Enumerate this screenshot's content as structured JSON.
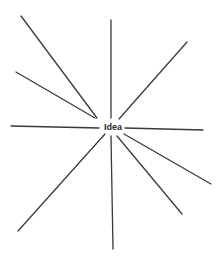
{
  "diagram": {
    "type": "radial-brainstorm",
    "center_label": "Idea",
    "line_color": "#3a3a3a",
    "rays": [
      {
        "id": "upper-left-long",
        "x1": 21,
        "y1": 16,
        "x2": 97,
        "y2": 118
      },
      {
        "id": "upper-left-short",
        "x1": 16,
        "y1": 72,
        "x2": 95,
        "y2": 118
      },
      {
        "id": "top-vertical",
        "x1": 111,
        "y1": 20,
        "x2": 111,
        "y2": 118
      },
      {
        "id": "upper-right",
        "x1": 187,
        "y1": 42,
        "x2": 119,
        "y2": 119
      },
      {
        "id": "left-horizontal",
        "x1": 11,
        "y1": 126,
        "x2": 99,
        "y2": 128
      },
      {
        "id": "right-horizontal",
        "x1": 125,
        "y1": 128,
        "x2": 203,
        "y2": 130
      },
      {
        "id": "lower-left",
        "x1": 105,
        "y1": 134,
        "x2": 18,
        "y2": 231
      },
      {
        "id": "bottom-vertical",
        "x1": 111,
        "y1": 136,
        "x2": 113,
        "y2": 249
      },
      {
        "id": "lower-right-steep",
        "x1": 117,
        "y1": 136,
        "x2": 182,
        "y2": 214
      },
      {
        "id": "lower-right-shallow",
        "x1": 124,
        "y1": 134,
        "x2": 211,
        "y2": 184
      }
    ]
  }
}
